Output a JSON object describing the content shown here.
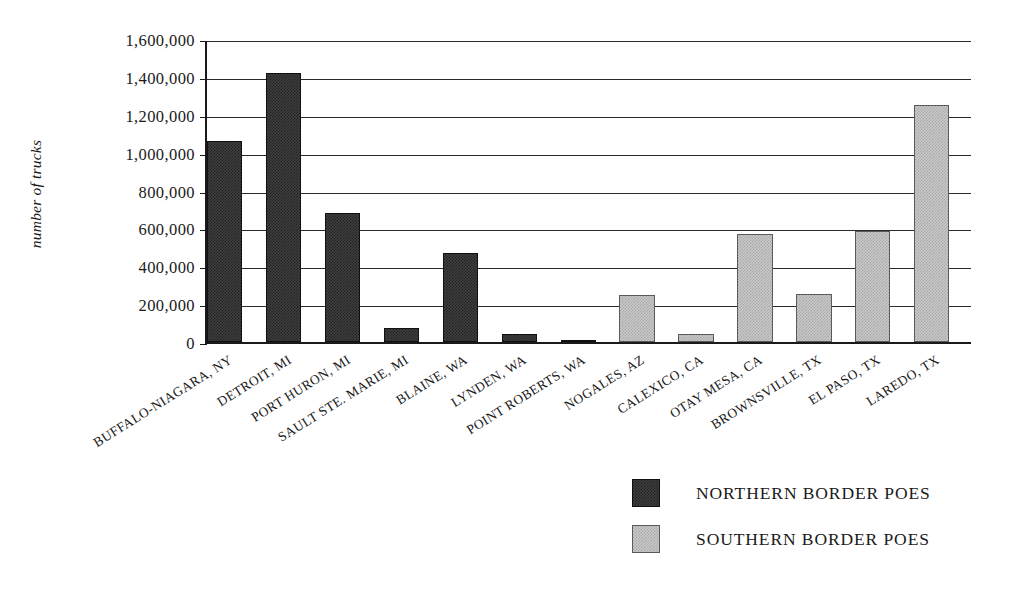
{
  "chart_data": {
    "type": "bar",
    "title": "",
    "subtitle": "",
    "xlabel": "",
    "ylabel": "number of trucks",
    "ylim": [
      0,
      1600000
    ],
    "ytick_values": [
      0,
      200000,
      400000,
      600000,
      800000,
      1000000,
      1200000,
      1400000,
      1600000
    ],
    "ytick_labels": [
      "0",
      "200,000",
      "400,000",
      "600,000",
      "800,000",
      "1,000,000",
      "1,200,000",
      "1,400,000",
      "1,600,000"
    ],
    "grid": true,
    "legend_position": "bottom-right",
    "categories": [
      "BUFFALO-NIAGARA, NY",
      "DETROIT, MI",
      "PORT HURON, MI",
      "SAULT STE. MARIE, MI",
      "BLAINE, WA",
      "LYNDEN, WA",
      "POINT ROBERTS, WA",
      "NOGALES, AZ",
      "CALEXICO, CA",
      "OTAY MESA, CA",
      "BROWNSVILLE, TX",
      "EL PASO, TX",
      "LAREDO, TX"
    ],
    "series": [
      {
        "name": "NORTHERN BORDER POES",
        "color": "#3f3f3f",
        "values": [
          1060000,
          1420000,
          680000,
          75000,
          470000,
          40000,
          10000,
          null,
          null,
          null,
          null,
          null,
          null
        ]
      },
      {
        "name": "SOUTHERN BORDER POES",
        "color": "#c9c9c9",
        "values": [
          null,
          null,
          null,
          null,
          null,
          null,
          null,
          250000,
          40000,
          570000,
          255000,
          585000,
          1250000
        ]
      }
    ],
    "bar_groups": [
      {
        "category": "BUFFALO-NIAGARA, NY",
        "series": "NORTHERN BORDER POES",
        "value": 1060000
      },
      {
        "category": "DETROIT, MI",
        "series": "NORTHERN BORDER POES",
        "value": 1420000
      },
      {
        "category": "PORT HURON, MI",
        "series": "NORTHERN BORDER POES",
        "value": 680000
      },
      {
        "category": "SAULT STE. MARIE, MI",
        "series": "NORTHERN BORDER POES",
        "value": 75000
      },
      {
        "category": "BLAINE, WA",
        "series": "NORTHERN BORDER POES",
        "value": 470000
      },
      {
        "category": "LYNDEN, WA",
        "series": "NORTHERN BORDER POES",
        "value": 40000
      },
      {
        "category": "POINT ROBERTS, WA",
        "series": "NORTHERN BORDER POES",
        "value": 10000
      },
      {
        "category": "NOGALES, AZ",
        "series": "SOUTHERN BORDER POES",
        "value": 250000
      },
      {
        "category": "CALEXICO, CA",
        "series": "SOUTHERN BORDER POES",
        "value": 40000
      },
      {
        "category": "OTAY MESA, CA",
        "series": "SOUTHERN BORDER POES",
        "value": 570000
      },
      {
        "category": "BROWNSVILLE, TX",
        "series": "SOUTHERN BORDER POES",
        "value": 255000
      },
      {
        "category": "EL PASO, TX",
        "series": "SOUTHERN BORDER POES",
        "value": 585000
      },
      {
        "category": "LAREDO, TX",
        "series": "SOUTHERN BORDER POES",
        "value": 1250000
      }
    ]
  },
  "legend": {
    "items": [
      {
        "label": "NORTHERN BORDER POES",
        "color": "#3f3f3f"
      },
      {
        "label": "SOUTHERN BORDER POES",
        "color": "#c9c9c9"
      }
    ]
  }
}
